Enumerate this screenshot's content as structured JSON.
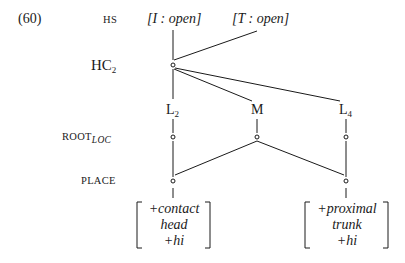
{
  "example_number": "(60)",
  "tiers": {
    "hs": "HS",
    "hc_main": "HC",
    "hc_sub": "2",
    "root_main": "ROOT",
    "root_sub": "LOC",
    "place": "PLACE"
  },
  "hs_features": [
    {
      "letter": "I",
      "value": "open"
    },
    {
      "letter": "T",
      "value": "open"
    }
  ],
  "hs_feature_text": [
    "[I : open]",
    "[T : open]"
  ],
  "segments": [
    {
      "main": "L",
      "sub": "2"
    },
    {
      "main": "M",
      "sub": ""
    },
    {
      "main": "L",
      "sub": "4"
    }
  ],
  "matrices": [
    {
      "lines": [
        "+contact",
        "head",
        "+hi"
      ]
    },
    {
      "lines": [
        "+proximal",
        "trunk",
        "+hi"
      ]
    }
  ],
  "colors": {
    "ink": "#1a1a1a",
    "background": "#ffffff"
  }
}
